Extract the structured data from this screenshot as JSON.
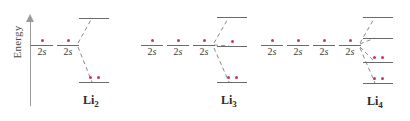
{
  "figure": {
    "type": "molecular-orbital-energy-diagram",
    "axis": {
      "label": "Energy",
      "direction": "up",
      "arrow_icon": "up-arrow-icon"
    },
    "accent_colors": {
      "electron_red": "#c03a5b",
      "level_gray": "#6a6a6a",
      "axis_gray": "#9a9a9a",
      "dashed_gray": "#8a8a8a"
    },
    "atomic_orbital_label": "2s",
    "atomic_orbital_label_number": "2",
    "atomic_orbital_label_letter": "s"
  },
  "groups": [
    {
      "id": "li2",
      "name": "Li2",
      "molecule_label": "Li",
      "molecule_subscript": "2",
      "atom_count": 2,
      "atomic_orbitals": [
        {
          "label": "2s",
          "electrons": 1,
          "x": 42,
          "y": 45
        },
        {
          "label": "2s",
          "electrons": 1,
          "x": 68,
          "y": 45
        }
      ],
      "molecular_orbitals": [
        {
          "electrons": 0,
          "x": 94,
          "y": 18
        },
        {
          "electrons": 2,
          "x": 94,
          "y": 82
        }
      ]
    },
    {
      "id": "li3",
      "name": "Li3",
      "molecule_label": "Li",
      "molecule_subscript": "3",
      "atom_count": 3,
      "atomic_orbitals": [
        {
          "label": "2s",
          "electrons": 1,
          "x": 152,
          "y": 45
        },
        {
          "label": "2s",
          "electrons": 1,
          "x": 178,
          "y": 45
        },
        {
          "label": "2s",
          "electrons": 1,
          "x": 204,
          "y": 45
        }
      ],
      "molecular_orbitals": [
        {
          "electrons": 0,
          "x": 232,
          "y": 17
        },
        {
          "electrons": 1,
          "x": 232,
          "y": 46
        },
        {
          "electrons": 2,
          "x": 232,
          "y": 82
        }
      ]
    },
    {
      "id": "li4",
      "name": "Li4",
      "molecule_label": "Li",
      "molecule_subscript": "4",
      "atom_count": 4,
      "atomic_orbitals": [
        {
          "label": "2s",
          "electrons": 1,
          "x": 272,
          "y": 45
        },
        {
          "label": "2s",
          "electrons": 1,
          "x": 298,
          "y": 45
        },
        {
          "label": "2s",
          "electrons": 1,
          "x": 324,
          "y": 45
        },
        {
          "label": "2s",
          "electrons": 1,
          "x": 350,
          "y": 45
        }
      ],
      "molecular_orbitals": [
        {
          "electrons": 0,
          "x": 378,
          "y": 17
        },
        {
          "electrons": 0,
          "x": 378,
          "y": 38
        },
        {
          "electrons": 2,
          "x": 378,
          "y": 62
        },
        {
          "electrons": 2,
          "x": 378,
          "y": 83
        }
      ]
    }
  ]
}
